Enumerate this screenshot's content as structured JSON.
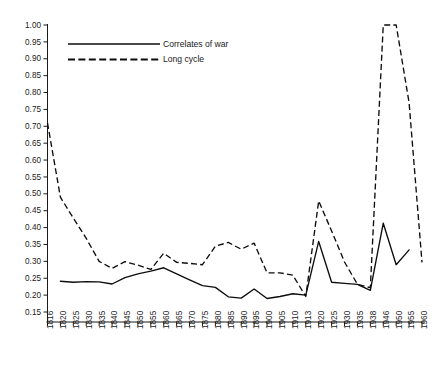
{
  "chart_data": {
    "type": "line",
    "title": "",
    "subtitle": "",
    "xlabel": "",
    "ylabel": "",
    "grid": false,
    "legend_position": "top-left",
    "ylim": [
      0.15,
      1.0
    ],
    "ytick_step": 0.05,
    "ytick_labels": [
      "1.00",
      "0.95",
      "0.90",
      "0.85",
      "0.80",
      "0.75",
      "0.70",
      "0.65",
      "0.60",
      "0.55",
      "0.50",
      "0.45",
      "0.40",
      "0.35",
      "0.30",
      "0.25",
      "0.20",
      "0.15"
    ],
    "ytick_values": [
      1.0,
      0.95,
      0.9,
      0.85,
      0.8,
      0.75,
      0.7,
      0.65,
      0.6,
      0.55,
      0.5,
      0.45,
      0.4,
      0.35,
      0.3,
      0.25,
      0.2,
      0.15
    ],
    "categories": [
      "1816",
      "1820",
      "1825",
      "1830",
      "1835",
      "1840",
      "1845",
      "1850",
      "1855",
      "1860",
      "1865",
      "1870",
      "1875",
      "1880",
      "1885",
      "1890",
      "1895",
      "1900",
      "1905",
      "1910",
      "1913",
      "1920",
      "1925",
      "1930",
      "1935",
      "1938",
      "1946",
      "1950",
      "1955",
      "1960"
    ],
    "series": [
      {
        "name": "Correlates of war",
        "style": "solid",
        "values": [
          null,
          0.241,
          0.238,
          0.24,
          0.239,
          0.233,
          0.252,
          0.263,
          0.271,
          0.281,
          0.263,
          0.245,
          0.228,
          0.223,
          0.195,
          0.191,
          0.218,
          0.19,
          0.196,
          0.204,
          0.2,
          0.359,
          0.238,
          0.235,
          0.232,
          0.214,
          0.413,
          0.29,
          0.334,
          null
        ]
      },
      {
        "name": "Long cycle",
        "style": "dashed",
        "values": [
          0.71,
          0.49,
          0.428,
          0.368,
          0.3,
          0.279,
          0.299,
          0.289,
          0.276,
          0.324,
          0.297,
          0.294,
          0.29,
          0.345,
          0.356,
          0.336,
          0.354,
          0.266,
          0.266,
          0.259,
          0.196,
          0.479,
          0.39,
          0.298,
          0.232,
          0.222,
          1.0,
          1.0,
          0.77,
          0.297
        ]
      }
    ]
  },
  "legend": {
    "items": [
      {
        "label": "Correlates of war",
        "style": "solid"
      },
      {
        "label": "Long cycle",
        "style": "dashed"
      }
    ]
  }
}
